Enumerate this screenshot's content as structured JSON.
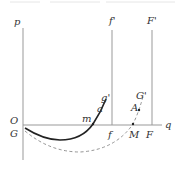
{
  "diagram": {
    "axes": {
      "vertical_label": "p",
      "horizontal_label": "q",
      "origin_label": "O"
    },
    "vertical_lines": [
      {
        "top_label": "f'",
        "bottom_label": "f"
      },
      {
        "top_label": "F'",
        "bottom_label": "F"
      }
    ],
    "curves": {
      "solid": {
        "start_label": "G",
        "crossing_label": "m",
        "mid_label": "a",
        "end_label": "g'"
      },
      "dashed": {
        "crossing_label": "M",
        "mid_label": "A",
        "end_label": "G'"
      }
    },
    "colors": {
      "axis": "#999999",
      "solid_curve": "#222222",
      "dashed_curve": "#888888",
      "text": "#333333"
    }
  }
}
